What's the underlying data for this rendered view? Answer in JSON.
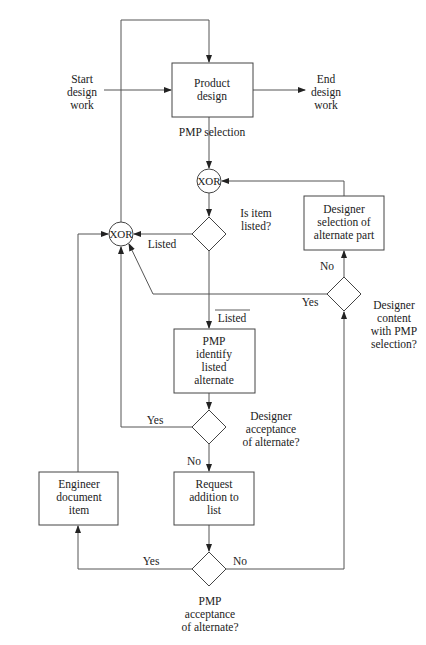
{
  "diagram": {
    "type": "flowchart",
    "nodes": {
      "start": {
        "lines": [
          "Start",
          "design",
          "work"
        ]
      },
      "end": {
        "lines": [
          "End",
          "design",
          "work"
        ]
      },
      "product_design": {
        "lines": [
          "Product",
          "design"
        ]
      },
      "pmp_selection_label": "PMP selection",
      "xor_top": "XOR",
      "xor_left": "XOR",
      "is_item_listed": {
        "lines": [
          "Is item",
          "listed?"
        ]
      },
      "designer_selection": {
        "lines": [
          "Designer",
          "selection of",
          "alternate part"
        ]
      },
      "designer_content": {
        "lines": [
          "Designer",
          "content",
          "with PMP",
          "selection?"
        ]
      },
      "pmp_identify": {
        "lines": [
          "PMP",
          "identify",
          "listed",
          "alternate"
        ]
      },
      "designer_acceptance": {
        "lines": [
          "Designer",
          "acceptance",
          "of alternate?"
        ]
      },
      "request_addition": {
        "lines": [
          "Request",
          "addition to",
          "list"
        ]
      },
      "engineer_document": {
        "lines": [
          "Engineer",
          "document",
          "item"
        ]
      },
      "pmp_acceptance": {
        "lines": [
          "PMP",
          "acceptance",
          "of alternate?"
        ]
      }
    },
    "edge_labels": {
      "listed": "Listed",
      "not_listed": "Listed",
      "content_no": "No",
      "content_yes": "Yes",
      "acceptance_yes": "Yes",
      "acceptance_no": "No",
      "pmp_yes": "Yes",
      "pmp_no": "No"
    }
  }
}
